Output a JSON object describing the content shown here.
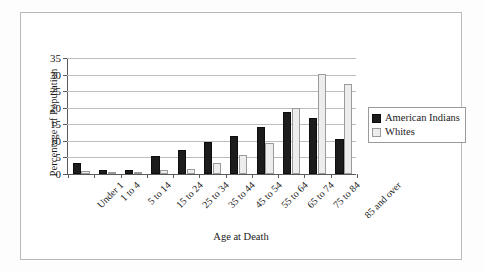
{
  "chart_data": {
    "type": "bar",
    "title": "",
    "xlabel": "Age at Death",
    "ylabel": "Percentage of Population",
    "categories": [
      "Under 1",
      "1 to 4",
      "5 to 14",
      "15 to 24",
      "25 to 34",
      "35 to 44",
      "45 to 54",
      "55 to 64",
      "65 to 74",
      "75 to 84",
      "85 and over"
    ],
    "series": [
      {
        "name": "American Indians",
        "color": "#1c1c1c",
        "values": [
          3.3,
          1.1,
          1.1,
          5.5,
          7.1,
          9.7,
          11.5,
          14.2,
          18.6,
          17.0,
          10.6
        ]
      },
      {
        "name": "Whites",
        "color": "#ededed",
        "values": [
          0.9,
          0.2,
          0.2,
          1.1,
          1.5,
          3.4,
          5.6,
          9.5,
          20.0,
          30.3,
          27.2
        ]
      }
    ],
    "ylim": [
      0,
      35
    ],
    "yticks": [
      0,
      5,
      10,
      15,
      20,
      25,
      30,
      35
    ],
    "ytick_labels": [
      "0",
      "5",
      "10",
      "15",
      "20",
      "25",
      "30",
      "35"
    ],
    "grid": true,
    "grid_axis": "y",
    "legend_position": "right",
    "xtick_label_rotation": -45
  },
  "axes": {
    "y_title": "Percentage of Population",
    "x_title": "Age at Death"
  },
  "legend": {
    "entries": [
      {
        "label": "American Indians",
        "swatch": "filled-black-square"
      },
      {
        "label": "Whites",
        "swatch": "outlined-white-square"
      }
    ]
  }
}
